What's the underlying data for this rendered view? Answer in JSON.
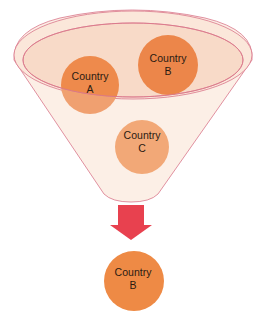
{
  "diagram": {
    "type": "funnel",
    "colors": {
      "funnel_fill": "#fcefe6",
      "funnel_rim_fill": "#f8dccb",
      "funnel_stroke": "#d9768a",
      "circle_a": "#ee9055",
      "circle_b": "#ec864a",
      "circle_c": "#f2a877",
      "arrow": "#e8414f",
      "result_circle": "#ee8a45"
    },
    "inputs": [
      {
        "id": "a",
        "line1": "Country",
        "line2": "A"
      },
      {
        "id": "b",
        "line1": "Country",
        "line2": "B"
      },
      {
        "id": "c",
        "line1": "Country",
        "line2": "C"
      }
    ],
    "output": {
      "line1": "Country",
      "line2": "B"
    }
  }
}
